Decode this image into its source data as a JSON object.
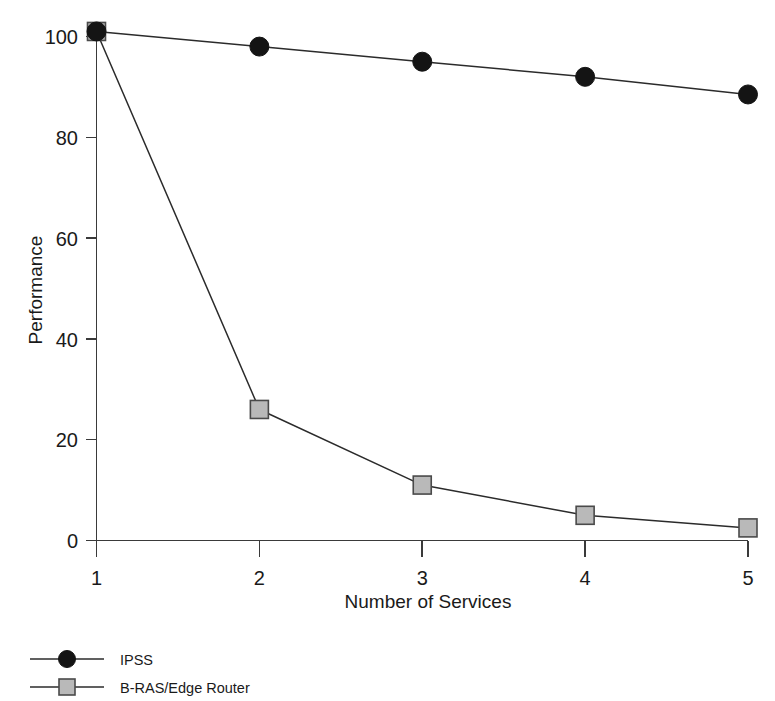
{
  "chart_data": {
    "type": "line",
    "title": "",
    "xlabel": "Number of Services",
    "ylabel": "Performance",
    "x": [
      1,
      2,
      3,
      4,
      5
    ],
    "xlim": [
      1,
      5
    ],
    "ylim": [
      0,
      105
    ],
    "xticks": [
      "1",
      "2",
      "3",
      "4",
      "5"
    ],
    "yticks": [
      "0",
      "20",
      "40",
      "60",
      "80",
      "100"
    ],
    "ytick_values": [
      0,
      20,
      40,
      60,
      80,
      100
    ],
    "grid": false,
    "legend_position": "below-left",
    "series": [
      {
        "name": "IPSS",
        "marker": "filled-circle",
        "color": "#141414",
        "values": [
          101,
          98,
          95,
          92,
          88.5
        ]
      },
      {
        "name": "B-RAS/Edge Router",
        "marker": "gray-square",
        "color": "#b9b9b9",
        "values": [
          101,
          26,
          11,
          5,
          2.5
        ]
      }
    ]
  },
  "axes": {
    "y_axis_title": "Performance",
    "x_axis_title": "Number of Services",
    "y_tick_labels": [
      "100",
      "80",
      "60",
      "40",
      "20",
      "0"
    ],
    "x_tick_labels": [
      "1",
      "2",
      "3",
      "4",
      "5"
    ]
  },
  "legend": {
    "entries": [
      {
        "label": "IPSS",
        "marker": "filled-circle"
      },
      {
        "label": "B-RAS/Edge Router",
        "marker": "gray-square"
      }
    ]
  },
  "colors": {
    "axis": "#3a3a3a",
    "line": "#2b2b2b",
    "circle_marker": "#141414",
    "square_marker_fill": "#b9b9b9",
    "square_marker_stroke": "#4a4a4a",
    "background": "#ffffff"
  }
}
